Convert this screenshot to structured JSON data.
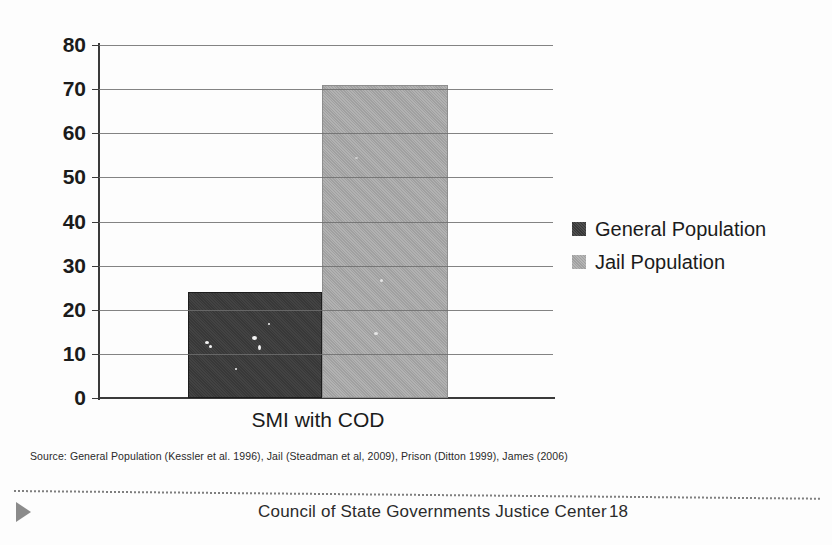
{
  "slide": {
    "top_cutoff_text": "",
    "source_note": "Source: General Population (Kessler et al. 1996), Jail (Steadman et al, 2009), Prison (Ditton 1999), James (2006)"
  },
  "footer": {
    "organization": "Council of State Governments Justice Center",
    "page_number": "18",
    "marker_icon": "play-triangle-icon"
  },
  "colors": {
    "general_population": "#3b3b3b",
    "jail_population": "#a9a9a9",
    "axis": "#3a3a3a",
    "gridline": "#6d6d6d",
    "background": "#fdfdfd"
  },
  "chart_data": {
    "type": "bar",
    "title": "",
    "xlabel": "",
    "ylabel": "",
    "categories": [
      "SMI with COD"
    ],
    "series": [
      {
        "name": "General Population",
        "values": [
          24
        ],
        "color": "#3b3b3b"
      },
      {
        "name": "Jail Population",
        "values": [
          71
        ],
        "color": "#a9a9a9"
      }
    ],
    "ylim": [
      0,
      80
    ],
    "yticks": [
      0,
      10,
      20,
      30,
      40,
      50,
      60,
      70,
      80
    ],
    "ytick_labels": [
      "0",
      "10",
      "20",
      "30",
      "40",
      "50",
      "60",
      "70",
      "80"
    ],
    "grid": true,
    "legend_position": "right",
    "annotations": []
  }
}
